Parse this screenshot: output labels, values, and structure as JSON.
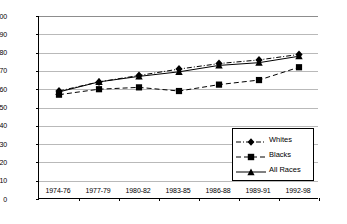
{
  "chart_data": {
    "type": "line",
    "title": "",
    "xlabel": "",
    "ylabel": "Percent",
    "ylim": [
      0,
      100
    ],
    "ytick_step": 10,
    "yticks": [
      0,
      10,
      20,
      30,
      40,
      50,
      60,
      70,
      80,
      90,
      100
    ],
    "grid": true,
    "legend_position": "inside-lower-right",
    "categories": [
      "1974-76",
      "1977-79",
      "1980-82",
      "1983-85",
      "1986-88",
      "1989-91",
      "1992-98"
    ],
    "series": [
      {
        "name": "Whites",
        "marker": "diamond",
        "line_style": "dash-dot",
        "color": "#000000",
        "values": [
          59,
          64,
          67.5,
          71,
          74,
          76,
          79
        ]
      },
      {
        "name": "Blacks",
        "marker": "square",
        "line_style": "dashed",
        "color": "#000000",
        "values": [
          57,
          60,
          61,
          59,
          62.5,
          65,
          72
        ]
      },
      {
        "name": "All Races",
        "marker": "triangle",
        "line_style": "solid",
        "color": "#000000",
        "values": [
          58.5,
          64,
          67,
          69.5,
          73,
          74.5,
          78
        ]
      }
    ]
  },
  "legend": {
    "items": [
      {
        "label": "Whites"
      },
      {
        "label": "Blacks"
      },
      {
        "label": "All Races"
      }
    ]
  },
  "colors": {
    "ink": "#000000",
    "grid": "#b9b9b9",
    "background": "#ffffff"
  }
}
